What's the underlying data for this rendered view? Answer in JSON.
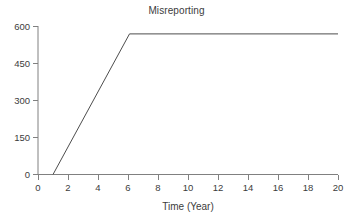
{
  "chart_data": {
    "type": "line",
    "title": "Misreporting",
    "xlabel": "Time (Year)",
    "ylabel": "",
    "xlim": [
      0,
      20
    ],
    "ylim": [
      0,
      600
    ],
    "xticks": [
      0,
      2,
      4,
      6,
      8,
      10,
      12,
      14,
      16,
      18,
      20
    ],
    "yticks": [
      0,
      150,
      300,
      450,
      600
    ],
    "xtick_labels": [
      "0",
      "2",
      "4",
      "6",
      "8",
      "10",
      "12",
      "14",
      "16",
      "18",
      "20"
    ],
    "ytick_labels": [
      "0",
      "150",
      "300",
      "450",
      "600"
    ],
    "grid": false,
    "legend": false,
    "line_color": "#4d4d4d",
    "series": [
      {
        "name": "Misreporting",
        "x": [
          1,
          6.1,
          20
        ],
        "values": [
          0,
          570,
          570
        ]
      }
    ],
    "annotations": []
  },
  "figure": {
    "background": "#ffffff",
    "axis_color": "#808080"
  }
}
